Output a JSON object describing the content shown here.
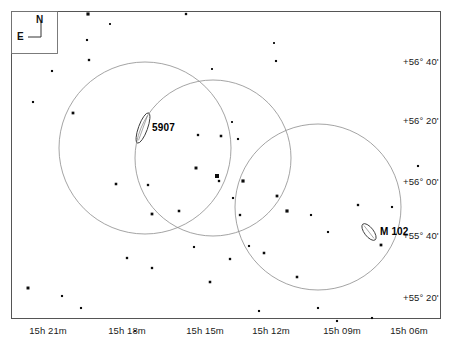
{
  "chart_data": {
    "type": "scatter",
    "title": "",
    "xlabel": "Right Ascension",
    "ylabel": "Declination",
    "grid": false,
    "legend": null,
    "projection": "equatorial sky chart (north up, east left)",
    "xtick_labels": [
      "15h 21m",
      "15h 18m",
      "15h 15m",
      "15h 12m",
      "15h 09m",
      "15h 06m"
    ],
    "xtick_px": [
      43,
      122,
      200,
      266,
      337,
      404
    ],
    "ytick_labels": [
      "+56° 40'",
      "+56° 20'",
      "+56° 00'",
      "+55° 40'",
      "+55° 20'"
    ],
    "ytick_px": [
      62,
      121,
      182,
      236,
      298
    ],
    "xlim": [
      "15h 22m",
      "15h 05m"
    ],
    "ylim": [
      "+55° 12'",
      "+56° 48'"
    ],
    "frame": {
      "x0": 11,
      "y0": 11,
      "x1": 440,
      "y1": 318
    },
    "objects": [
      {
        "name": "5907",
        "type": "galaxy-edge-on",
        "cx": 143,
        "cy": 128,
        "rx": 4.5,
        "ry": 16,
        "angle": 20,
        "label_x": 152,
        "label_y": 122
      },
      {
        "name": "M 102",
        "type": "galaxy-edge-on",
        "cx": 369,
        "cy": 232,
        "rx": 4.5,
        "ry": 10,
        "angle": -38,
        "label_x": 380,
        "label_y": 226
      }
    ],
    "fields_of_view": [
      {
        "cx": 145,
        "cy": 148,
        "r": 86
      },
      {
        "cx": 213,
        "cy": 158,
        "r": 78
      },
      {
        "cx": 318,
        "cy": 207,
        "r": 83
      }
    ],
    "stars": [
      {
        "x": 88,
        "y": 14,
        "mag": 3.0
      },
      {
        "x": 186,
        "y": 14,
        "mag": 2.2
      },
      {
        "x": 110,
        "y": 24,
        "mag": 1.8
      },
      {
        "x": 87,
        "y": 40,
        "mag": 2.0
      },
      {
        "x": 276,
        "y": 61,
        "mag": 2.0
      },
      {
        "x": 274,
        "y": 43,
        "mag": 1.8
      },
      {
        "x": 89,
        "y": 60,
        "mag": 2.2
      },
      {
        "x": 52,
        "y": 71,
        "mag": 2.0
      },
      {
        "x": 33,
        "y": 102,
        "mag": 2.0
      },
      {
        "x": 73,
        "y": 113,
        "mag": 2.6
      },
      {
        "x": 212,
        "y": 69,
        "mag": 1.8
      },
      {
        "x": 198,
        "y": 135,
        "mag": 2.2
      },
      {
        "x": 221,
        "y": 136,
        "mag": 2.4
      },
      {
        "x": 238,
        "y": 139,
        "mag": 2.0
      },
      {
        "x": 196,
        "y": 168,
        "mag": 2.8
      },
      {
        "x": 217,
        "y": 176,
        "mag": 3.8
      },
      {
        "x": 243,
        "y": 181,
        "mag": 3.0
      },
      {
        "x": 233,
        "y": 198,
        "mag": 2.0
      },
      {
        "x": 277,
        "y": 196,
        "mag": 2.6
      },
      {
        "x": 148,
        "y": 185,
        "mag": 2.2
      },
      {
        "x": 116,
        "y": 184,
        "mag": 2.4
      },
      {
        "x": 179,
        "y": 211,
        "mag": 2.4
      },
      {
        "x": 152,
        "y": 214,
        "mag": 2.6
      },
      {
        "x": 219,
        "y": 181,
        "mag": 2.2
      },
      {
        "x": 240,
        "y": 215,
        "mag": 2.2
      },
      {
        "x": 287,
        "y": 211,
        "mag": 3.0
      },
      {
        "x": 311,
        "y": 215,
        "mag": 2.0
      },
      {
        "x": 358,
        "y": 205,
        "mag": 2.2
      },
      {
        "x": 381,
        "y": 245,
        "mag": 2.6
      },
      {
        "x": 392,
        "y": 207,
        "mag": 2.0
      },
      {
        "x": 328,
        "y": 232,
        "mag": 2.0
      },
      {
        "x": 264,
        "y": 253,
        "mag": 2.4
      },
      {
        "x": 230,
        "y": 259,
        "mag": 2.2
      },
      {
        "x": 194,
        "y": 247,
        "mag": 2.0
      },
      {
        "x": 127,
        "y": 258,
        "mag": 2.2
      },
      {
        "x": 28,
        "y": 288,
        "mag": 2.8
      },
      {
        "x": 62,
        "y": 296,
        "mag": 2.0
      },
      {
        "x": 81,
        "y": 308,
        "mag": 2.0
      },
      {
        "x": 210,
        "y": 282,
        "mag": 2.4
      },
      {
        "x": 152,
        "y": 268,
        "mag": 2.2
      },
      {
        "x": 297,
        "y": 277,
        "mag": 2.4
      },
      {
        "x": 259,
        "y": 311,
        "mag": 2.0
      },
      {
        "x": 318,
        "y": 308,
        "mag": 2.0
      },
      {
        "x": 337,
        "y": 321,
        "mag": 2.0
      },
      {
        "x": 372,
        "y": 318,
        "mag": 2.0
      },
      {
        "x": 135,
        "y": 331,
        "mag": 1.8
      },
      {
        "x": 249,
        "y": 246,
        "mag": 2.0
      },
      {
        "x": 418,
        "y": 166,
        "mag": 2.0
      },
      {
        "x": 232,
        "y": 122,
        "mag": 1.8
      }
    ]
  },
  "compass": {
    "north_label": "N",
    "east_label": "E"
  }
}
